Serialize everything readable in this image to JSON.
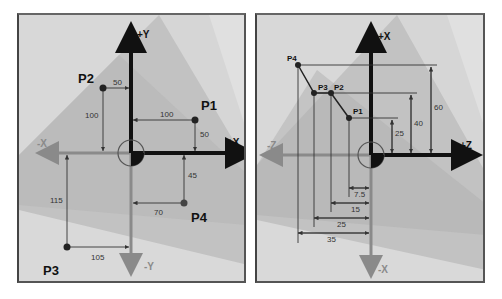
{
  "left_diagram": {
    "axes": {
      "pos_y": "+Y",
      "neg_y": "-Y",
      "pos_x": "+X",
      "neg_x": "-X"
    },
    "points": [
      {
        "name": "P1",
        "x": 100,
        "y": 50
      },
      {
        "name": "P2",
        "x": -50,
        "y": 100
      },
      {
        "name": "P3",
        "x": -105,
        "y": -115
      },
      {
        "name": "P4",
        "x": 70,
        "y": -45
      }
    ],
    "dimensions": {
      "p2_x": "50",
      "p2_y": "100",
      "p1_x": "100",
      "p1_y": "50",
      "p3_y": "115",
      "p3_x": "105",
      "p4_y": "45",
      "p4_x": "70"
    }
  },
  "right_diagram": {
    "axes": {
      "pos_x": "+X",
      "neg_x": "-X",
      "pos_z": "+Z",
      "neg_z": "-Z"
    },
    "points": [
      {
        "name": "P1",
        "z": -7.5,
        "x": 25
      },
      {
        "name": "P2",
        "z": -15,
        "x": 40
      },
      {
        "name": "P3",
        "z": -25,
        "x": 40
      },
      {
        "name": "P4",
        "z": -35,
        "x": 60
      }
    ],
    "dimensions": {
      "x_60": "60",
      "x_40": "40",
      "x_25": "25",
      "z_75": "7.5",
      "z_15": "15",
      "z_25": "25",
      "z_35": "35"
    }
  },
  "colors": {
    "panel_bg_light": "#dcdcdc",
    "panel_bg_mid": "#c4c4c4",
    "panel_bg_dark": "#a8a8a8",
    "axis_positive": "#111111",
    "axis_negative": "#8a8a8a",
    "dim_line": "#333333"
  }
}
